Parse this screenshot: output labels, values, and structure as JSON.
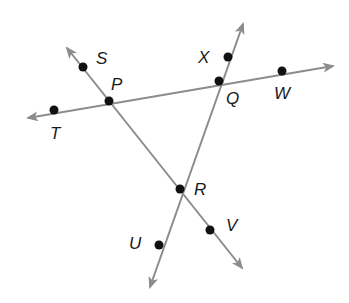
{
  "diagram": {
    "line_color": "#8c8c8c",
    "point_color": "#111111",
    "lines": [
      {
        "id": "line-TW",
        "label": "Line through T, P, Q, W",
        "start": {
          "x": 28,
          "y": 118
        },
        "end": {
          "x": 333,
          "y": 66
        },
        "arrow_start": true,
        "arrow_end": true
      },
      {
        "id": "line-SV",
        "label": "Line through S, P, R, V",
        "start": {
          "x": 67,
          "y": 48
        },
        "end": {
          "x": 242,
          "y": 268
        },
        "arrow_start": true,
        "arrow_end": true
      },
      {
        "id": "line-XU",
        "label": "Line through X, Q, R, U",
        "start": {
          "x": 243,
          "y": 24
        },
        "end": {
          "x": 150,
          "y": 287
        },
        "arrow_start": true,
        "arrow_end": true
      }
    ],
    "points": [
      {
        "name": "S",
        "x": 83,
        "y": 67,
        "label_x": 96,
        "label_y": 64
      },
      {
        "name": "P",
        "x": 109,
        "y": 101,
        "label_x": 111,
        "label_y": 90
      },
      {
        "name": "T",
        "x": 54,
        "y": 110,
        "label_x": 50,
        "label_y": 139
      },
      {
        "name": "X",
        "x": 228,
        "y": 57,
        "label_x": 198,
        "label_y": 63
      },
      {
        "name": "Q",
        "x": 219,
        "y": 81,
        "label_x": 226,
        "label_y": 104
      },
      {
        "name": "W",
        "x": 282,
        "y": 71,
        "label_x": 274,
        "label_y": 99
      },
      {
        "name": "R",
        "x": 180,
        "y": 189,
        "label_x": 194,
        "label_y": 195
      },
      {
        "name": "U",
        "x": 159,
        "y": 245,
        "label_x": 129,
        "label_y": 249
      },
      {
        "name": "V",
        "x": 210,
        "y": 230,
        "label_x": 226,
        "label_y": 231
      }
    ]
  }
}
